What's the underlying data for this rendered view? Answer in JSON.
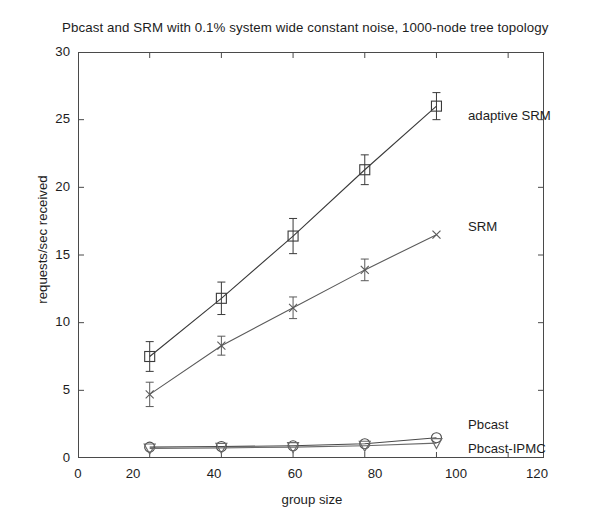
{
  "chart_data": {
    "type": "line",
    "title": "Pbcast and SRM with 0.1% system wide constant noise, 1000-node tree topology",
    "xlabel": "group size",
    "ylabel": "requests/sec received",
    "xlim": [
      0,
      130
    ],
    "ylim": [
      0,
      30
    ],
    "xticks": [
      0,
      20,
      40,
      60,
      80,
      100,
      120
    ],
    "yticks": [
      0,
      5,
      10,
      15,
      20,
      25,
      30
    ],
    "grid": false,
    "legend_position": "inline-annotations",
    "x": [
      20,
      40,
      60,
      80,
      100
    ],
    "series": [
      {
        "name": "adaptive SRM",
        "marker": "square",
        "color": "#3a3a3a",
        "values": [
          7.5,
          11.8,
          16.4,
          21.3,
          26.0
        ],
        "error": [
          1.1,
          1.2,
          1.3,
          1.1,
          1.0
        ],
        "annotation": "adaptive SRM"
      },
      {
        "name": "SRM",
        "marker": "x",
        "color": "#5a5a5a",
        "values": [
          4.7,
          8.3,
          11.1,
          13.9,
          16.5
        ],
        "error": [
          0.9,
          0.7,
          0.8,
          0.8,
          0.0
        ],
        "annotation": "SRM"
      },
      {
        "name": "Pbcast",
        "marker": "circle",
        "color": "#4a4a4a",
        "values": [
          0.8,
          0.85,
          0.9,
          1.05,
          1.5
        ],
        "error": [
          0.0,
          0.0,
          0.0,
          0.0,
          0.0
        ],
        "annotation": "Pbcast"
      },
      {
        "name": "Pbcast-IPMC",
        "marker": "triangle-down",
        "color": "#6a6a6a",
        "values": [
          0.7,
          0.75,
          0.8,
          0.9,
          1.1
        ],
        "error": [
          0.0,
          0.0,
          0.0,
          0.0,
          0.0
        ],
        "annotation": "Pbcast-IPMC"
      }
    ]
  },
  "axes": {
    "y_tick_labels": [
      "30",
      "25",
      "20",
      "15",
      "10",
      "5",
      "0"
    ],
    "x_tick_labels": [
      "0",
      "20",
      "40",
      "60",
      "80",
      "100",
      "120"
    ]
  },
  "annotations": {
    "adaptive_srm": "adaptive SRM",
    "srm": "SRM",
    "pbcast": "Pbcast",
    "pbcast_ipmc": "Pbcast-IPMC"
  }
}
